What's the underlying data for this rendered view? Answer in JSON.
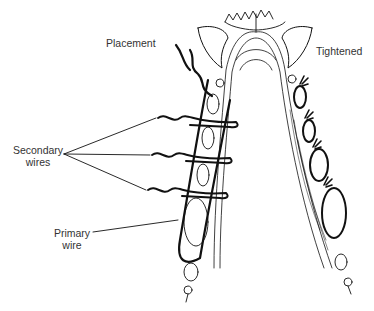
{
  "diagram": {
    "labels": {
      "placement": "Placement",
      "tightened": "Tightened",
      "secondary_wires_line1": "Secondary",
      "secondary_wires_line2": "wires",
      "primary_wire_line1": "Primary",
      "primary_wire_line2": "wire"
    },
    "colors": {
      "line": "#111111",
      "label_text": "#333333",
      "background": "#ffffff"
    },
    "views": [
      "Placement",
      "Tightened"
    ],
    "secondary_wire_count": 3,
    "tightened_tooth_count": 4
  }
}
